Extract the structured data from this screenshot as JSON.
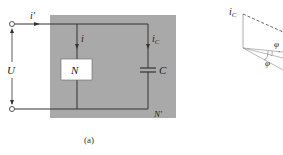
{
  "figure": {
    "caption": "(a)",
    "circuit": {
      "source_current_label": "i'",
      "voltage_label": "U",
      "branch_current_label": "i",
      "capacitor_current_label": "iC",
      "capacitor_current_base": "i",
      "capacitor_current_sub": "C",
      "load_label": "N",
      "capacitor_label": "C",
      "network_label": "N'",
      "box_color": "#a9a9a9",
      "wire_color": "#333333"
    },
    "phasor": {
      "current_label_base": "i",
      "current_label_sub": "C",
      "angle_label_1": "φ",
      "angle_label_2": "φ",
      "angle_label_2_prime": "'"
    }
  }
}
